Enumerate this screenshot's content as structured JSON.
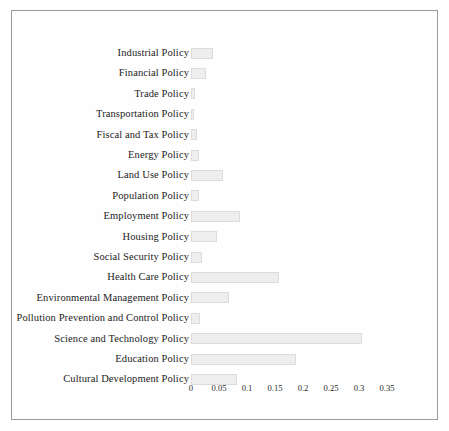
{
  "chart_data": {
    "type": "bar",
    "orientation": "horizontal",
    "title": "",
    "xlabel": "",
    "ylabel": "",
    "xlim": [
      0,
      0.37
    ],
    "grid": false,
    "legend": null,
    "xticks": [
      "0",
      "0.05",
      "0.1",
      "0.15",
      "0.2",
      "0.25",
      "0.3",
      "0.35"
    ],
    "xtick_values": [
      0,
      0.05,
      0.1,
      0.15,
      0.2,
      0.25,
      0.3,
      0.35
    ],
    "categories": [
      "Industrial Policy",
      "Financial Policy",
      "Trade Policy",
      "Transportation Policy",
      "Fiscal and Tax Policy",
      "Energy Policy",
      "Land Use Policy",
      "Population Policy",
      "Employment Policy",
      "Housing Policy",
      "Social Security Policy",
      "Health Care Policy",
      "Environmental Management Policy",
      "Pollution Prevention and Control Policy",
      "Science and Technology Policy",
      "Education Policy",
      "Cultural Development Policy"
    ],
    "values": [
      0.039,
      0.027,
      0.007,
      0.006,
      0.01,
      0.015,
      0.058,
      0.014,
      0.088,
      0.047,
      0.02,
      0.157,
      0.067,
      0.016,
      0.305,
      0.187,
      0.082
    ],
    "bar_color": "#eeeeee",
    "bar_edge_color": "#dcdcdc",
    "frame_color": "#9a9a9a",
    "text_color": "#1c1c1c",
    "background_color": "#ffffff"
  }
}
